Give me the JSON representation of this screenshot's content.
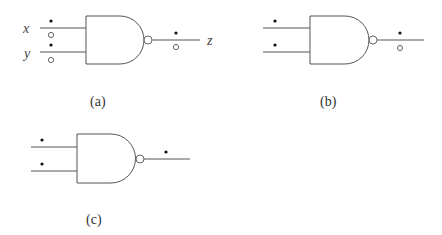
{
  "figure": {
    "panels": [
      {
        "id": "a",
        "caption": "(a)",
        "gate": "NAND",
        "inputs": [
          {
            "name": "x",
            "tokens": [
              "filled",
              "empty"
            ]
          },
          {
            "name": "y",
            "tokens": [
              "filled",
              "empty"
            ]
          }
        ],
        "output": {
          "name": "z",
          "tokens": [
            "filled",
            "empty"
          ]
        }
      },
      {
        "id": "b",
        "caption": "(b)",
        "gate": "NAND",
        "inputs": [
          {
            "name": "",
            "tokens": [
              "filled"
            ]
          },
          {
            "name": "",
            "tokens": [
              "filled"
            ]
          }
        ],
        "output": {
          "name": "",
          "tokens": [
            "filled",
            "empty"
          ]
        }
      },
      {
        "id": "c",
        "caption": "(c)",
        "gate": "NAND",
        "inputs": [
          {
            "name": "",
            "tokens": [
              "filled"
            ]
          },
          {
            "name": "",
            "tokens": [
              "filled"
            ]
          }
        ],
        "output": {
          "name": "",
          "tokens": [
            "filled"
          ]
        }
      }
    ]
  },
  "labels": {
    "x": "x",
    "y": "y",
    "z": "z",
    "cap_a": "(a)",
    "cap_b": "(b)",
    "cap_c": "(c)"
  },
  "colors": {
    "line": "#555555",
    "token_filled": "#111111",
    "background": "#ffffff"
  }
}
